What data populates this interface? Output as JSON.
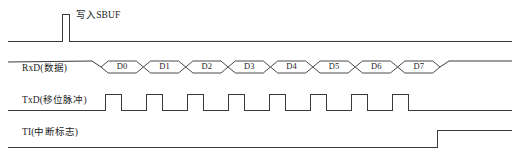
{
  "figure": {
    "kind": "timing-diagram",
    "background_color": "#ffffff",
    "line_color": "#3a3a3a",
    "text_color": "#1d1d1d",
    "width": 521,
    "height": 163
  },
  "signals": [
    {
      "key": "write_sbuf",
      "label": "写入SBUF",
      "row_y": 41,
      "high_y": 14,
      "pulse": {
        "start_x": 62,
        "end_x": 69
      },
      "line_start_x": 8,
      "line_end_x": 512
    },
    {
      "key": "rxd",
      "label": "RxD(数据)",
      "row_y": 74,
      "data_start_x": 101,
      "data_end_x": 440,
      "line_start_x": 8,
      "line_end_x": 512
    },
    {
      "key": "txd",
      "label": "TxD(移位脉冲)",
      "row_y": 110,
      "high_y": 94,
      "line_start_x": 8,
      "line_end_x": 512,
      "pulse_count": 8,
      "pulse_start_x": 105,
      "pulse_width": 16,
      "pulse_period": 41
    },
    {
      "key": "ti",
      "label": "TI(中断标志)",
      "row_y": 147,
      "high_y": 130,
      "rise_x": 437,
      "line_start_x": 8,
      "line_end_x": 512
    }
  ],
  "chart_data": {
    "type": "line",
    "title": "",
    "xlabel": "",
    "ylabel": "",
    "grid": false,
    "legend": "none",
    "series": [
      {
        "name": "写入SBUF",
        "values": [
          0,
          1,
          0,
          0,
          0,
          0,
          0,
          0,
          0,
          0
        ]
      },
      {
        "name": "RxD(数据)",
        "values": [
          0,
          0,
          0,
          0,
          0,
          0,
          0,
          0,
          0,
          0
        ]
      },
      {
        "name": "TxD(移位脉冲)",
        "values": [
          0,
          0,
          1,
          1,
          1,
          1,
          1,
          1,
          1,
          1
        ]
      },
      {
        "name": "TI(中断标志)",
        "values": [
          0,
          0,
          0,
          0,
          0,
          0,
          0,
          0,
          0,
          1
        ]
      }
    ]
  },
  "data_bits": [
    {
      "name": "D0",
      "center_x": 124,
      "index": 0
    },
    {
      "name": "D1",
      "center_x": 166,
      "index": 1
    },
    {
      "name": "D2",
      "center_x": 208,
      "index": 2
    },
    {
      "name": "D3",
      "center_x": 250,
      "index": 3
    },
    {
      "name": "D4",
      "center_x": 292,
      "index": 4
    },
    {
      "name": "D5",
      "center_x": 334,
      "index": 5
    },
    {
      "name": "D6",
      "center_x": 375,
      "index": 6
    },
    {
      "name": "D7",
      "center_x": 416,
      "index": 7
    }
  ]
}
